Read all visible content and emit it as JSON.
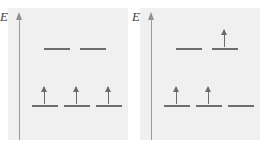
{
  "figure": {
    "type": "energy-level-diagram",
    "background_color": "#ffffff",
    "panel_color": "#eff0ef",
    "line_color": "#6e6e6e",
    "arrow_color": "#6b6b6b",
    "axis_color": "#9a9a9a"
  },
  "panels": [
    {
      "id": "left",
      "axis_label": "E",
      "axis_icon": "up-arrow-axis",
      "rows": [
        {
          "name": "upper-level-row",
          "energy": "upper",
          "orbitals": [
            {
              "name": "orbital-upper-1",
              "occupied": false,
              "spin": ""
            },
            {
              "name": "orbital-upper-2",
              "occupied": false,
              "spin": ""
            }
          ]
        },
        {
          "name": "lower-level-row",
          "energy": "lower",
          "orbitals": [
            {
              "name": "orbital-lower-1",
              "occupied": true,
              "spin": "up"
            },
            {
              "name": "orbital-lower-2",
              "occupied": true,
              "spin": "up"
            },
            {
              "name": "orbital-lower-3",
              "occupied": true,
              "spin": "up"
            }
          ]
        }
      ]
    },
    {
      "id": "right",
      "axis_label": "E",
      "axis_icon": "up-arrow-axis",
      "rows": [
        {
          "name": "upper-level-row",
          "energy": "upper",
          "orbitals": [
            {
              "name": "orbital-upper-1",
              "occupied": false,
              "spin": ""
            },
            {
              "name": "orbital-upper-2",
              "occupied": true,
              "spin": "up"
            }
          ]
        },
        {
          "name": "lower-level-row",
          "energy": "lower",
          "orbitals": [
            {
              "name": "orbital-lower-1",
              "occupied": true,
              "spin": "up"
            },
            {
              "name": "orbital-lower-2",
              "occupied": true,
              "spin": "up"
            },
            {
              "name": "orbital-lower-3",
              "occupied": false,
              "spin": ""
            }
          ]
        }
      ]
    }
  ],
  "geometry": {
    "upper_row_y": 40,
    "lower_row_y": 97,
    "upper_x_positions": [
      36,
      72
    ],
    "lower_x_positions": [
      24,
      56,
      88
    ]
  }
}
